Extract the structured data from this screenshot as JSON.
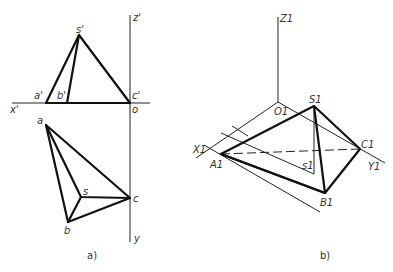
{
  "figure_a": {
    "caption": "a)",
    "axis_labels": {
      "z": "z'",
      "x": "x'",
      "origin": "o",
      "y": "y"
    },
    "front_view_labels": {
      "s": "s'",
      "a": "a'",
      "b": "b'",
      "c": "c'"
    },
    "top_view_labels": {
      "a": "a",
      "s": "s",
      "b": "b",
      "c": "c"
    }
  },
  "figure_b": {
    "caption": "b)",
    "axis_labels": {
      "z": "Z1",
      "x": "X1",
      "y": "Y1",
      "origin": "O1"
    },
    "point_labels": {
      "S": "S1",
      "A": "A1",
      "B": "B1",
      "C": "C1",
      "s": "s1"
    }
  },
  "colors": {
    "line": "#111111",
    "text": "#333333",
    "background": "#ffffff"
  }
}
